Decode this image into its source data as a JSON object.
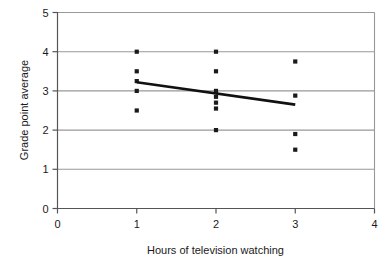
{
  "chart_data": {
    "type": "scatter",
    "title": "",
    "xlabel": "Hours of television watching",
    "ylabel": "Grade point average",
    "xlim": [
      0,
      4
    ],
    "ylim": [
      0,
      5
    ],
    "xticks": [
      "0",
      "1",
      "2",
      "3",
      "4"
    ],
    "yticks": [
      "0",
      "1",
      "2",
      "3",
      "4",
      "5"
    ],
    "xtick_values": [
      0,
      1,
      2,
      3,
      4
    ],
    "ytick_values": [
      0,
      1,
      2,
      3,
      4,
      5
    ],
    "grid": "horizontal",
    "legend": "none",
    "marker": "square",
    "marker_color": "#1a1a1a",
    "gridline_color": "#999999",
    "axis_color": "#555555",
    "series": [
      {
        "name": "Students",
        "points": [
          {
            "x": 1,
            "y": 4.0
          },
          {
            "x": 1,
            "y": 3.5
          },
          {
            "x": 1,
            "y": 3.25
          },
          {
            "x": 1,
            "y": 3.0
          },
          {
            "x": 1,
            "y": 2.5
          },
          {
            "x": 2,
            "y": 4.0
          },
          {
            "x": 2,
            "y": 3.5
          },
          {
            "x": 2,
            "y": 3.0
          },
          {
            "x": 2,
            "y": 2.85
          },
          {
            "x": 2,
            "y": 2.7
          },
          {
            "x": 2,
            "y": 2.55
          },
          {
            "x": 2,
            "y": 2.0
          },
          {
            "x": 3,
            "y": 3.75
          },
          {
            "x": 3,
            "y": 2.88
          },
          {
            "x": 3,
            "y": 1.9
          },
          {
            "x": 3,
            "y": 1.5
          }
        ]
      }
    ],
    "trendline": {
      "name": "regression-line",
      "color": "#111111",
      "width": 2.6,
      "x0": 1.0,
      "y0": 3.22,
      "x1": 3.0,
      "y1": 2.65
    }
  }
}
